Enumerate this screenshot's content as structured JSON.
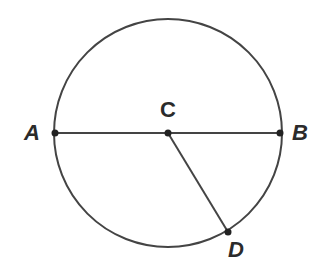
{
  "diagram": {
    "type": "circle-geometry",
    "circle": {
      "center": "C",
      "cx": 168,
      "cy": 133,
      "r": 114
    },
    "points": [
      {
        "id": "A",
        "label": "A",
        "x": 55,
        "y": 133
      },
      {
        "id": "B",
        "label": "B",
        "x": 280,
        "y": 133
      },
      {
        "id": "C",
        "label": "C",
        "x": 168,
        "y": 133
      },
      {
        "id": "D",
        "label": "D",
        "x": 228,
        "y": 232
      }
    ],
    "segments": [
      {
        "from": "A",
        "to": "B",
        "role": "diameter"
      },
      {
        "from": "C",
        "to": "D",
        "role": "radius"
      }
    ],
    "colors": {
      "stroke": "#444444",
      "point": "#222222",
      "label": "#2b2b2b"
    }
  }
}
